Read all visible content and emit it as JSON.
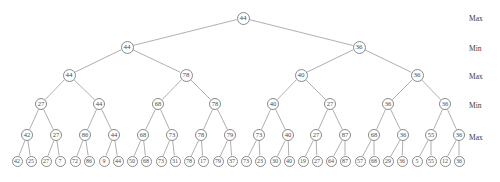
{
  "figure": {
    "node_stroke": "#8a8a8a",
    "edge_stroke": "#9a9a9a",
    "text_color": "#4a4a4a",
    "background": "#ffffff"
  },
  "level_labels": [
    {
      "text": "Max",
      "y": 14
    },
    {
      "text": "Min",
      "y": 44
    },
    {
      "text": "Max",
      "y": 72
    },
    {
      "text": "Min",
      "y": 101
    },
    {
      "text": "Max",
      "y": 133
    }
  ],
  "levels": [
    {
      "index": 1,
      "kind": "Max",
      "y": 18,
      "values": [
        44
      ]
    },
    {
      "index": 2,
      "kind": "Min",
      "y": 47,
      "values": [
        44,
        36
      ]
    },
    {
      "index": 3,
      "kind": "Max",
      "y": 75,
      "values": [
        44,
        78,
        40,
        36
      ]
    },
    {
      "index": 4,
      "kind": "Min",
      "y": 104,
      "values": [
        27,
        44,
        68,
        78,
        40,
        27,
        36,
        36
      ]
    },
    {
      "index": 5,
      "kind": "Max",
      "y": 135,
      "values": [
        42,
        27,
        86,
        44,
        68,
        73,
        78,
        79,
        73,
        40,
        27,
        87,
        68,
        36,
        55,
        36
      ]
    },
    {
      "index": 6,
      "kind": "Leaf",
      "y": 161,
      "values": [
        42,
        25,
        27,
        7,
        72,
        86,
        9,
        44,
        50,
        68,
        73,
        31,
        78,
        17,
        79,
        37,
        73,
        23,
        30,
        40,
        19,
        27,
        64,
        87,
        57,
        68,
        29,
        36,
        5,
        55,
        12,
        36
      ]
    }
  ],
  "node_positions": {
    "level1": [
      243
    ],
    "level2": [
      127,
      359
    ],
    "level3": [
      69,
      186,
      301,
      417
    ],
    "level4": [
      41,
      99,
      158,
      215,
      273,
      330,
      388,
      445
    ],
    "level5": [
      27,
      56,
      85,
      114,
      143,
      172,
      201,
      230,
      259,
      288,
      316,
      345,
      374,
      403,
      431,
      459
    ],
    "level6": [
      17,
      31,
      46,
      60,
      75,
      89,
      104,
      118,
      132,
      146,
      161,
      175,
      189,
      203,
      218,
      232,
      246,
      260,
      275,
      289,
      303,
      317,
      331,
      345,
      360,
      374,
      388,
      402,
      417,
      431,
      445,
      459
    ]
  }
}
